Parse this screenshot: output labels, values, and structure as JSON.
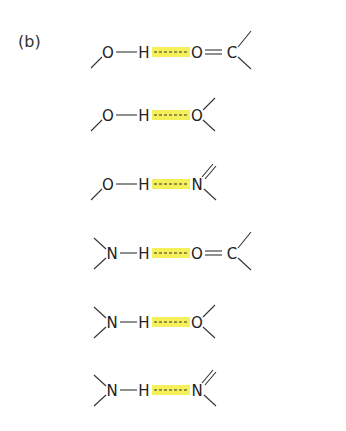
{
  "figure": {
    "panel_label": "(b)",
    "highlight_color": "#f5ef5a",
    "rows": [
      {
        "donor": "O",
        "hydrogen": "H",
        "acceptor": "O",
        "acceptor_partner": "C",
        "acceptor_bond": "double",
        "donor_type": "hydroxyl",
        "acceptor_type": "carbonyl"
      },
      {
        "donor": "O",
        "hydrogen": "H",
        "acceptor": "O",
        "acceptor_partner": "",
        "acceptor_bond": "single-branches",
        "donor_type": "hydroxyl",
        "acceptor_type": "ether/hydroxyl"
      },
      {
        "donor": "O",
        "hydrogen": "H",
        "acceptor": "N",
        "acceptor_partner": "",
        "acceptor_bond": "double-branch",
        "donor_type": "hydroxyl",
        "acceptor_type": "imine"
      },
      {
        "donor": "N",
        "hydrogen": "H",
        "acceptor": "O",
        "acceptor_partner": "C",
        "acceptor_bond": "double",
        "donor_type": "amine",
        "acceptor_type": "carbonyl"
      },
      {
        "donor": "N",
        "hydrogen": "H",
        "acceptor": "O",
        "acceptor_partner": "",
        "acceptor_bond": "single-branches",
        "donor_type": "amine",
        "acceptor_type": "ether/hydroxyl"
      },
      {
        "donor": "N",
        "hydrogen": "H",
        "acceptor": "N",
        "acceptor_partner": "",
        "acceptor_bond": "double-branch",
        "donor_type": "amine",
        "acceptor_type": "imine"
      }
    ]
  }
}
